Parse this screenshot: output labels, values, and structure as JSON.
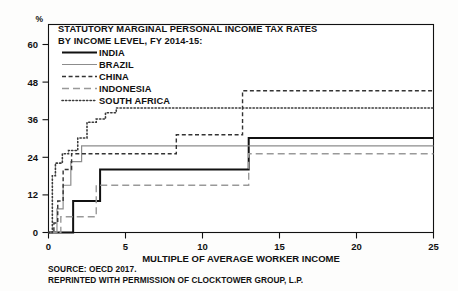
{
  "chart_data": {
    "type": "line",
    "title_line1": "STATUTORY MARGINAL PERSONAL INCOME TAX RATES",
    "title_line2": "BY INCOME LEVEL, FY 2014-15:",
    "xlabel": "MULTIPLE OF AVERAGE WORKER INCOME",
    "ylabel": "%",
    "xlim": [
      0,
      25
    ],
    "ylim": [
      0,
      66
    ],
    "xticks": [
      "0",
      "5",
      "10",
      "15",
      "20",
      "25"
    ],
    "xtick_values": [
      0,
      5,
      10,
      15,
      20,
      25
    ],
    "yticks": [
      "0",
      "12",
      "24",
      "36",
      "48",
      "60"
    ],
    "ytick_values": [
      0,
      12,
      24,
      36,
      48,
      60
    ],
    "grid": false,
    "legend_position": "top-left-inside",
    "step": "post",
    "series": [
      {
        "name": "INDIA",
        "color": "#111111",
        "style": "solid",
        "width": 2.0,
        "points": [
          [
            0,
            0
          ],
          [
            1.6,
            0
          ],
          [
            1.6,
            10
          ],
          [
            3.35,
            10
          ],
          [
            3.35,
            10
          ],
          [
            3.35,
            20
          ],
          [
            6.6,
            20
          ],
          [
            6.6,
            20
          ],
          [
            13.0,
            20
          ],
          [
            13.0,
            30
          ],
          [
            25,
            30
          ]
        ]
      },
      {
        "name": "BRAZIL",
        "color": "#8c8c8c",
        "style": "solid",
        "width": 1.2,
        "points": [
          [
            0,
            0
          ],
          [
            0.55,
            0
          ],
          [
            0.55,
            7.5
          ],
          [
            0.95,
            7.5
          ],
          [
            0.95,
            15
          ],
          [
            1.45,
            15
          ],
          [
            1.45,
            22.5
          ],
          [
            2.15,
            22.5
          ],
          [
            2.15,
            27.5
          ],
          [
            25,
            27.5
          ]
        ]
      },
      {
        "name": "CHINA",
        "color": "#333333",
        "style": "dashed-fine",
        "width": 1.4,
        "points": [
          [
            0,
            0
          ],
          [
            0.35,
            0
          ],
          [
            0.35,
            3
          ],
          [
            0.6,
            3
          ],
          [
            0.6,
            10
          ],
          [
            0.95,
            10
          ],
          [
            0.95,
            20
          ],
          [
            1.5,
            20
          ],
          [
            1.5,
            25
          ],
          [
            2.7,
            25
          ],
          [
            2.7,
            25
          ],
          [
            8.3,
            25
          ],
          [
            8.3,
            31
          ],
          [
            12.6,
            31
          ],
          [
            12.6,
            45
          ],
          [
            25,
            45
          ]
        ]
      },
      {
        "name": "INDONESIA",
        "color": "#999999",
        "style": "dashed-long",
        "width": 1.4,
        "points": [
          [
            0,
            0
          ],
          [
            0.8,
            0
          ],
          [
            0.8,
            5
          ],
          [
            3.1,
            5
          ],
          [
            3.1,
            15
          ],
          [
            13.0,
            15
          ],
          [
            13.0,
            25
          ],
          [
            25,
            25
          ]
        ]
      },
      {
        "name": "SOUTH AFRICA",
        "color": "#3a3a3a",
        "style": "dotted",
        "width": 1.6,
        "points": [
          [
            0,
            0
          ],
          [
            0.25,
            0
          ],
          [
            0.25,
            18
          ],
          [
            0.45,
            18
          ],
          [
            0.45,
            22
          ],
          [
            0.9,
            22
          ],
          [
            0.9,
            25
          ],
          [
            1.3,
            25
          ],
          [
            1.3,
            26
          ],
          [
            1.9,
            26
          ],
          [
            1.9,
            30
          ],
          [
            2.5,
            30
          ],
          [
            2.5,
            35
          ],
          [
            3.1,
            35
          ],
          [
            3.1,
            36
          ],
          [
            3.7,
            36
          ],
          [
            3.7,
            38
          ],
          [
            4.4,
            38
          ],
          [
            4.4,
            39.5
          ],
          [
            25,
            39.5
          ]
        ]
      }
    ]
  },
  "legend": {
    "items": [
      {
        "label": "INDIA",
        "key": "legend-swatch-india"
      },
      {
        "label": "BRAZIL",
        "key": "legend-swatch-brazil"
      },
      {
        "label": "CHINA",
        "key": "legend-swatch-china"
      },
      {
        "label": "INDONESIA",
        "key": "legend-swatch-indonesia"
      },
      {
        "label": "SOUTH AFRICA",
        "key": "legend-swatch-south-africa"
      }
    ]
  },
  "footer": {
    "source_line": "SOURCE: OECD 2017.",
    "reprint_line": "REPRINTED WITH PERMISSION OF CLOCKTOWER GROUP, L.P."
  }
}
